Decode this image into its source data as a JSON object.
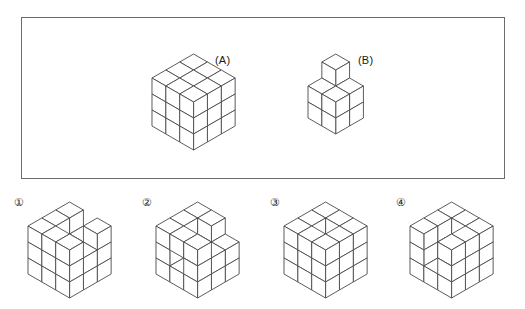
{
  "page": {
    "background_color": "#ffffff",
    "line_color": "#4a4a4a",
    "face_color": "#ffffff",
    "border_color": "#6b6b6b",
    "text_color": "#1a1a1a",
    "type": "spatial-reasoning-cube-puzzle"
  },
  "question_panel": {
    "figures": [
      {
        "id": "A",
        "label": "(A)",
        "description": "solid 3x3x3 cube",
        "cell": 16,
        "origin_x": 48,
        "origin_y": 16,
        "voxels": [
          [
            0,
            0,
            0
          ],
          [
            1,
            0,
            0
          ],
          [
            2,
            0,
            0
          ],
          [
            0,
            1,
            0
          ],
          [
            1,
            1,
            0
          ],
          [
            2,
            1,
            0
          ],
          [
            0,
            2,
            0
          ],
          [
            1,
            2,
            0
          ],
          [
            2,
            2,
            0
          ],
          [
            0,
            0,
            1
          ],
          [
            1,
            0,
            1
          ],
          [
            2,
            0,
            1
          ],
          [
            0,
            1,
            1
          ],
          [
            1,
            1,
            1
          ],
          [
            2,
            1,
            1
          ],
          [
            0,
            2,
            1
          ],
          [
            1,
            2,
            1
          ],
          [
            2,
            2,
            1
          ],
          [
            0,
            0,
            2
          ],
          [
            1,
            0,
            2
          ],
          [
            2,
            0,
            2
          ],
          [
            0,
            1,
            2
          ],
          [
            1,
            1,
            2
          ],
          [
            2,
            1,
            2
          ],
          [
            0,
            2,
            2
          ],
          [
            1,
            2,
            2
          ],
          [
            2,
            2,
            2
          ]
        ]
      },
      {
        "id": "B",
        "label": "(B)",
        "description": "2x2x2 block plus one cube on the back top corner",
        "cell": 16,
        "origin_x": 34,
        "origin_y": 16,
        "voxels": [
          [
            0,
            0,
            0
          ],
          [
            1,
            0,
            0
          ],
          [
            0,
            1,
            0
          ],
          [
            1,
            1,
            0
          ],
          [
            0,
            0,
            1
          ],
          [
            1,
            0,
            1
          ],
          [
            0,
            1,
            1
          ],
          [
            1,
            1,
            1
          ],
          [
            0,
            0,
            2
          ]
        ]
      }
    ]
  },
  "options": [
    {
      "number": "①",
      "name": "option-1",
      "cell": 16,
      "origin_x": 48,
      "origin_y": 14,
      "voxels": [
        [
          0,
          0,
          0
        ],
        [
          1,
          0,
          0
        ],
        [
          2,
          0,
          0
        ],
        [
          0,
          1,
          0
        ],
        [
          1,
          1,
          0
        ],
        [
          2,
          1,
          0
        ],
        [
          0,
          2,
          0
        ],
        [
          1,
          2,
          0
        ],
        [
          2,
          2,
          0
        ],
        [
          0,
          0,
          1
        ],
        [
          1,
          0,
          1
        ],
        [
          2,
          0,
          1
        ],
        [
          0,
          1,
          1
        ],
        [
          2,
          1,
          1
        ],
        [
          0,
          2,
          1
        ],
        [
          1,
          2,
          1
        ],
        [
          2,
          2,
          1
        ],
        [
          0,
          0,
          2
        ],
        [
          2,
          0,
          2
        ],
        [
          0,
          1,
          2
        ],
        [
          0,
          2,
          2
        ],
        [
          1,
          2,
          2
        ],
        [
          2,
          2,
          2
        ]
      ]
    },
    {
      "number": "②",
      "name": "option-2",
      "cell": 16,
      "origin_x": 48,
      "origin_y": 14,
      "voxels": [
        [
          0,
          0,
          0
        ],
        [
          1,
          0,
          0
        ],
        [
          2,
          0,
          0
        ],
        [
          0,
          1,
          0
        ],
        [
          1,
          1,
          0
        ],
        [
          2,
          1,
          0
        ],
        [
          0,
          2,
          0
        ],
        [
          1,
          2,
          0
        ],
        [
          2,
          2,
          0
        ],
        [
          0,
          0,
          1
        ],
        [
          1,
          0,
          1
        ],
        [
          2,
          0,
          1
        ],
        [
          0,
          1,
          1
        ],
        [
          2,
          1,
          1
        ],
        [
          0,
          2,
          1
        ],
        [
          2,
          2,
          1
        ],
        [
          0,
          0,
          2
        ],
        [
          1,
          0,
          2
        ],
        [
          0,
          1,
          2
        ],
        [
          0,
          2,
          2
        ],
        [
          1,
          2,
          2
        ],
        [
          2,
          2,
          2
        ]
      ]
    },
    {
      "number": "③",
      "name": "option-3",
      "cell": 16,
      "origin_x": 48,
      "origin_y": 14,
      "voxels": [
        [
          0,
          0,
          0
        ],
        [
          1,
          0,
          0
        ],
        [
          2,
          0,
          0
        ],
        [
          0,
          1,
          0
        ],
        [
          1,
          1,
          0
        ],
        [
          2,
          1,
          0
        ],
        [
          0,
          2,
          0
        ],
        [
          1,
          2,
          0
        ],
        [
          2,
          2,
          0
        ],
        [
          0,
          0,
          1
        ],
        [
          1,
          0,
          1
        ],
        [
          2,
          0,
          1
        ],
        [
          0,
          1,
          1
        ],
        [
          2,
          1,
          1
        ],
        [
          0,
          2,
          1
        ],
        [
          1,
          2,
          1
        ],
        [
          2,
          2,
          1
        ],
        [
          0,
          0,
          2
        ],
        [
          1,
          0,
          2
        ],
        [
          2,
          0,
          2
        ],
        [
          0,
          1,
          2
        ],
        [
          2,
          1,
          2
        ],
        [
          0,
          2,
          2
        ],
        [
          1,
          2,
          2
        ],
        [
          2,
          2,
          2
        ]
      ]
    },
    {
      "number": "④",
      "name": "option-4",
      "cell": 16,
      "origin_x": 48,
      "origin_y": 14,
      "voxels": [
        [
          0,
          0,
          0
        ],
        [
          1,
          0,
          0
        ],
        [
          2,
          0,
          0
        ],
        [
          0,
          1,
          0
        ],
        [
          1,
          1,
          0
        ],
        [
          2,
          1,
          0
        ],
        [
          0,
          2,
          0
        ],
        [
          1,
          2,
          0
        ],
        [
          2,
          2,
          0
        ],
        [
          0,
          0,
          1
        ],
        [
          1,
          0,
          1
        ],
        [
          2,
          0,
          1
        ],
        [
          0,
          1,
          1
        ],
        [
          1,
          1,
          1
        ],
        [
          2,
          1,
          1
        ],
        [
          0,
          2,
          1
        ],
        [
          2,
          2,
          1
        ],
        [
          0,
          0,
          2
        ],
        [
          1,
          0,
          2
        ],
        [
          2,
          0,
          2
        ],
        [
          0,
          1,
          2
        ],
        [
          2,
          1,
          2
        ],
        [
          0,
          2,
          2
        ],
        [
          2,
          2,
          2
        ]
      ]
    }
  ]
}
